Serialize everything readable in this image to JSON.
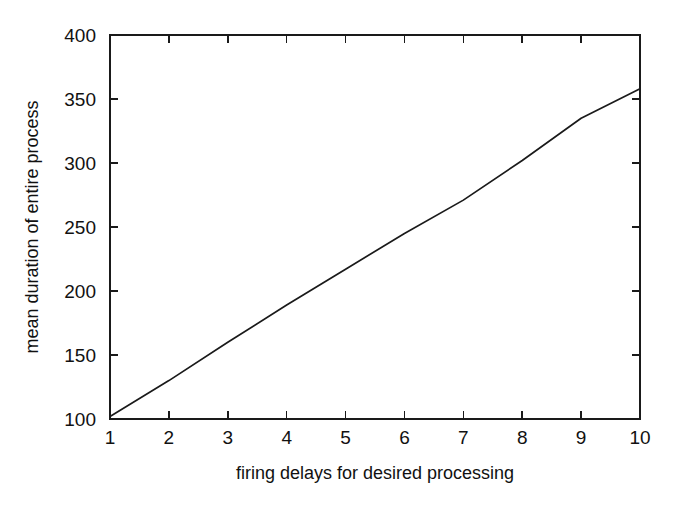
{
  "chart_data": {
    "type": "line",
    "title": "",
    "subtitle": "",
    "xlabel": "firing delays for desired processing",
    "ylabel": "mean duration of entire process",
    "x": [
      1,
      2,
      3,
      4,
      5,
      6,
      7,
      8,
      9,
      10
    ],
    "values": [
      102,
      130,
      160,
      189,
      217,
      245,
      271,
      302,
      335,
      358
    ],
    "series": [
      {
        "name": "mean duration",
        "values": [
          102,
          130,
          160,
          189,
          217,
          245,
          271,
          302,
          335,
          358
        ]
      }
    ],
    "xlim": [
      1,
      10
    ],
    "ylim": [
      100,
      400
    ],
    "xticks": [
      1,
      2,
      3,
      4,
      5,
      6,
      7,
      8,
      9,
      10
    ],
    "xticklabels": [
      "1",
      "2",
      "3",
      "4",
      "5",
      "6",
      "7",
      "8",
      "9",
      "10"
    ],
    "yticks": [
      100,
      150,
      200,
      250,
      300,
      350,
      400
    ],
    "yticklabels": [
      "100",
      "150",
      "200",
      "250",
      "300",
      "350",
      "400"
    ],
    "grid": false,
    "legend": null,
    "legend_position": "none",
    "line_color": "#1a1a1a",
    "background_color": "#ffffff",
    "annotations": []
  }
}
